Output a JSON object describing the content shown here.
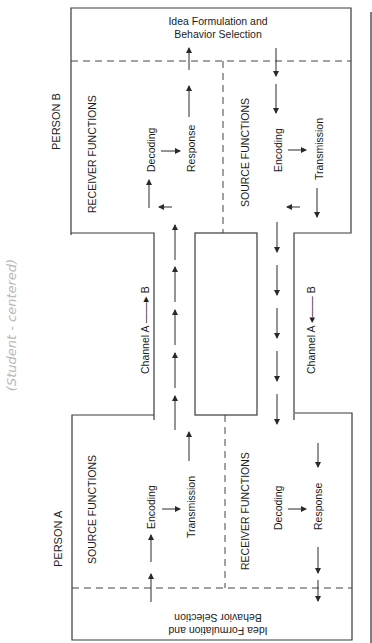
{
  "person_b": {
    "label": "PERSON B",
    "idea_line1": "Idea Formulation and",
    "idea_line2": "Behavior Selection",
    "receiver_title": "RECEIVER FUNCTIONS",
    "source_title": "SOURCE FUNCTIONS",
    "decoding": "Decoding",
    "response": "Response",
    "encoding": "Encoding",
    "transmission": "Transmission"
  },
  "person_a": {
    "label": "PERSON A",
    "idea_line1": "Idea Formulation and",
    "idea_line2": "Behavior Selection",
    "source_title": "SOURCE FUNCTIONS",
    "receiver_title": "RECEIVER FUNCTIONS",
    "encoding": "Encoding",
    "transmission": "Transmission",
    "decoding": "Decoding",
    "response": "Response"
  },
  "channels": {
    "a_to_b": "Channel A ——▸ B",
    "b_to_a": "Channel A ◂—— B"
  },
  "annotation": {
    "handwritten": "(Student - centered)"
  },
  "colors": {
    "line": "#3a3a3a",
    "text": "#1c1c1c",
    "handwriting": "#b8b8b8"
  }
}
